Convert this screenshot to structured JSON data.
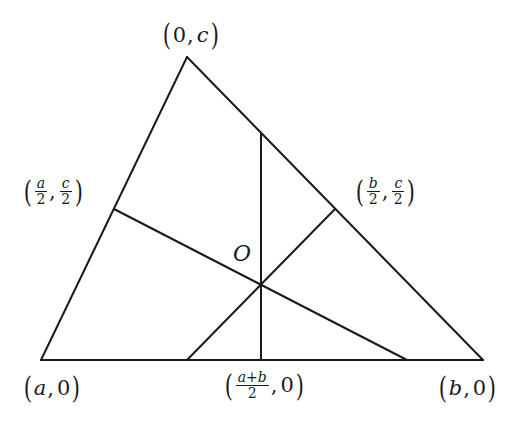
{
  "figure": {
    "stroke_color": "#1a1a1a",
    "background": "#ffffff"
  },
  "vertices": {
    "top": {
      "label_x": "0",
      "label_y": "c"
    },
    "bottom_left": {
      "label_x": "a",
      "label_y": "0"
    },
    "bottom_right": {
      "label_x": "b",
      "label_y": "0"
    }
  },
  "midpoints": {
    "left_side": {
      "x_num": "a",
      "x_den": "2",
      "y_num": "c",
      "y_den": "2"
    },
    "right_side": {
      "x_num": "b",
      "x_den": "2",
      "y_num": "c",
      "y_den": "2"
    },
    "base": {
      "x_num": "a+b",
      "x_den": "2",
      "y": "0"
    }
  },
  "center": {
    "label": "O"
  },
  "punctuation": {
    "open": "(",
    "close": ")",
    "comma": ","
  }
}
